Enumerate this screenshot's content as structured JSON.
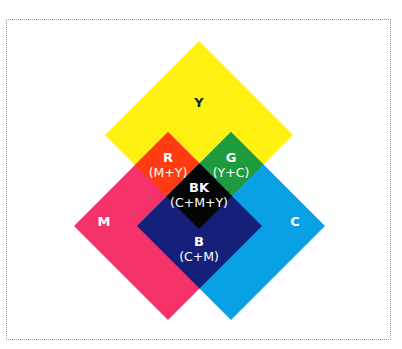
{
  "diagram": {
    "colors": {
      "yellow": "#FFF212",
      "magenta": "#F5316A",
      "cyan": "#0AA0E6",
      "red": "#FF3B0F",
      "green": "#1E9B3C",
      "blue": "#15207A",
      "black": "#050505",
      "label_dark": "#222222",
      "label_light": "#FFFFFF",
      "border": "#9A9A9A"
    },
    "regions": {
      "yellow": {
        "label": "Y"
      },
      "magenta": {
        "label": "M"
      },
      "cyan": {
        "label": "C"
      },
      "red": {
        "label": "R",
        "formula": "(M+Y)"
      },
      "green": {
        "label": "G",
        "formula": "(Y+C)"
      },
      "black": {
        "label": "BK",
        "formula": "(C+M+Y)"
      },
      "blue": {
        "label": "B",
        "formula": "(C+M)"
      }
    }
  }
}
